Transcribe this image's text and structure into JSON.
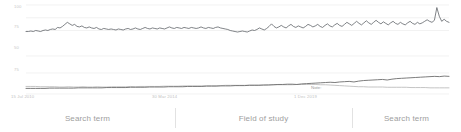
{
  "chart_data": [
    {
      "type": "line",
      "title": "",
      "panel": "top",
      "xlabel": "",
      "ylabel": "",
      "grid": true,
      "legend_position": "none",
      "ylim": [
        0,
        100
      ],
      "yticks": [
        "100",
        "75",
        "50"
      ],
      "xticks": [
        "15 Jul 2010",
        "30 Mar 2014",
        "1 Dec 2019"
      ],
      "series": [
        {
          "name": "Search term",
          "color": "#5f6368",
          "x": [
            0,
            1,
            2,
            3,
            4,
            5,
            6,
            7,
            8,
            9,
            10,
            11,
            12,
            13,
            14,
            15,
            16,
            17,
            18,
            19,
            20,
            21,
            22,
            23,
            24,
            25,
            26,
            27,
            28,
            29,
            30,
            31,
            32,
            33,
            34,
            35,
            36,
            37,
            38,
            39,
            40,
            41,
            42,
            43,
            44,
            45,
            46,
            47,
            48,
            49,
            50,
            51,
            52,
            53,
            54,
            55,
            56,
            57,
            58,
            59,
            60,
            61,
            62,
            63,
            64,
            65,
            66,
            67,
            68,
            69,
            70,
            71,
            72,
            73,
            74,
            75,
            76,
            77,
            78,
            79,
            80,
            81,
            82,
            83,
            84,
            85,
            86,
            87,
            88,
            89,
            90,
            91,
            92,
            93,
            94,
            95,
            96,
            97,
            98,
            99,
            100,
            101,
            102,
            103,
            104,
            105,
            106,
            107,
            108,
            109,
            110,
            111,
            112,
            113,
            114,
            115,
            116,
            117,
            118,
            119,
            120,
            121,
            122,
            123,
            124,
            125,
            126,
            127,
            128,
            129,
            130,
            131,
            132,
            133,
            134,
            135,
            136,
            137,
            138,
            139,
            140,
            141,
            142,
            143,
            144,
            145,
            146,
            147,
            148,
            149,
            150,
            151,
            152,
            153,
            154,
            155,
            156,
            157,
            158,
            159,
            160,
            161,
            162,
            163,
            164,
            165,
            166,
            167,
            168,
            169,
            170,
            171,
            172,
            173,
            174,
            175,
            176,
            177,
            178,
            179
          ],
          "values": [
            48,
            48,
            49,
            48,
            50,
            49,
            48,
            50,
            51,
            50,
            52,
            53,
            52,
            56,
            55,
            58,
            62,
            66,
            63,
            60,
            62,
            58,
            57,
            59,
            56,
            55,
            57,
            55,
            54,
            56,
            53,
            52,
            54,
            53,
            52,
            53,
            52,
            51,
            53,
            52,
            51,
            53,
            54,
            52,
            53,
            55,
            53,
            52,
            54,
            56,
            54,
            53,
            55,
            54,
            53,
            55,
            54,
            53,
            55,
            57,
            55,
            54,
            56,
            55,
            54,
            56,
            55,
            54,
            56,
            55,
            54,
            55,
            57,
            55,
            54,
            56,
            55,
            54,
            56,
            57,
            55,
            54,
            53,
            52,
            50,
            49,
            48,
            47,
            48,
            49,
            48,
            47,
            49,
            51,
            50,
            52,
            55,
            53,
            51,
            54,
            58,
            63,
            58,
            55,
            57,
            60,
            57,
            55,
            59,
            62,
            58,
            56,
            59,
            57,
            55,
            58,
            62,
            60,
            57,
            59,
            62,
            58,
            56,
            60,
            63,
            59,
            57,
            61,
            64,
            60,
            58,
            62,
            66,
            63,
            60,
            64,
            68,
            64,
            61,
            65,
            69,
            65,
            62,
            66,
            70,
            66,
            63,
            67,
            64,
            61,
            65,
            68,
            64,
            62,
            66,
            63,
            61,
            65,
            68,
            64,
            62,
            66,
            63,
            65,
            68,
            71,
            68,
            66,
            70,
            95,
            78,
            68,
            72,
            68,
            66
          ]
        }
      ]
    },
    {
      "type": "line",
      "title": "",
      "panel": "bottom",
      "xlabel": "",
      "ylabel": "",
      "grid": true,
      "legend_position": "none",
      "ylim": [
        0,
        100
      ],
      "yticks": [
        "75"
      ],
      "annotations": [
        {
          "label": "Note:",
          "x": 311,
          "y": 85
        }
      ],
      "series": [
        {
          "name": "Field of study",
          "color": "#bdbdbd",
          "x": [
            0,
            1,
            2,
            3,
            4,
            5,
            6,
            7,
            8,
            9,
            10,
            11,
            12,
            13,
            14,
            15,
            16,
            17,
            18,
            19,
            20,
            21,
            22,
            23,
            24,
            25,
            26,
            27,
            28,
            29,
            30,
            31,
            32,
            33,
            34,
            35,
            36,
            37,
            38,
            39,
            40,
            41,
            42,
            43,
            44,
            45,
            46,
            47,
            48,
            49,
            50,
            51,
            52,
            53,
            54,
            55,
            56,
            57,
            58,
            59,
            60,
            61,
            62,
            63,
            64,
            65,
            66,
            67,
            68,
            69,
            70,
            71,
            72,
            73,
            74,
            75,
            76,
            77,
            78,
            79,
            80,
            81,
            82,
            83,
            84,
            85,
            86,
            87,
            88,
            89
          ],
          "values": [
            27,
            27,
            27,
            26,
            26,
            26,
            26,
            25,
            25,
            26,
            25,
            25,
            26,
            25,
            25,
            26,
            25,
            25,
            26,
            26,
            26,
            26,
            27,
            26,
            27,
            27,
            27,
            27,
            27,
            28,
            28,
            28,
            28,
            29,
            29,
            29,
            29,
            29,
            30,
            30,
            30,
            30,
            31,
            31,
            31,
            31,
            31,
            32,
            32,
            32,
            32,
            33,
            33,
            33,
            33,
            33,
            33,
            34,
            34,
            34,
            34,
            34,
            33,
            33,
            32,
            31,
            30,
            29,
            28,
            27,
            26,
            26,
            25,
            25,
            25,
            25,
            24,
            24,
            24,
            24,
            24,
            23,
            23,
            23,
            23,
            22,
            22,
            22,
            22,
            22
          ]
        },
        {
          "name": "Search term",
          "color": "#6d6d6d",
          "x": [
            0,
            1,
            2,
            3,
            4,
            5,
            6,
            7,
            8,
            9,
            10,
            11,
            12,
            13,
            14,
            15,
            16,
            17,
            18,
            19,
            20,
            21,
            22,
            23,
            24,
            25,
            26,
            27,
            28,
            29,
            30,
            31,
            32,
            33,
            34,
            35,
            36,
            37,
            38,
            39,
            40,
            41,
            42,
            43,
            44,
            45,
            46,
            47,
            48,
            49,
            50,
            51,
            52,
            53,
            54,
            55,
            56,
            57,
            58,
            59,
            60,
            61,
            62,
            63,
            64,
            65,
            66,
            67,
            68,
            69,
            70,
            71,
            72,
            73,
            74,
            75,
            76,
            77,
            78,
            79,
            80,
            81,
            82,
            83,
            84,
            85,
            86,
            87,
            88,
            89
          ],
          "values": [
            20,
            20,
            20,
            20,
            20,
            21,
            21,
            21,
            21,
            21,
            21,
            22,
            22,
            22,
            22,
            22,
            22,
            23,
            23,
            23,
            23,
            23,
            24,
            24,
            24,
            24,
            25,
            25,
            25,
            25,
            26,
            26,
            26,
            26,
            27,
            27,
            27,
            27,
            28,
            28,
            28,
            29,
            29,
            29,
            30,
            30,
            30,
            31,
            31,
            31,
            32,
            32,
            33,
            34,
            34,
            35,
            35,
            34,
            36,
            37,
            38,
            39,
            40,
            41,
            42,
            41,
            43,
            44,
            45,
            43,
            46,
            48,
            49,
            50,
            51,
            52,
            50,
            53,
            55,
            56,
            57,
            58,
            59,
            60,
            61,
            62,
            63,
            62,
            64,
            63
          ]
        }
      ]
    }
  ],
  "axes": {
    "top_yticks": [
      {
        "label": "100",
        "top": 6
      },
      {
        "label": "75",
        "top": 26
      },
      {
        "label": "50",
        "top": 47
      }
    ],
    "bottom_yticks": [
      {
        "label": "75",
        "top": 69
      }
    ],
    "xticks": [
      {
        "label": "15 Jul 2010",
        "left": 11
      },
      {
        "label": "30 Mar 2014",
        "left": 152
      },
      {
        "label": "1 Dec 2019",
        "left": 294
      }
    ]
  },
  "annotation": {
    "note_label": "Note:"
  },
  "legend": {
    "items": [
      {
        "label": "Search term"
      },
      {
        "label": "Field of study"
      },
      {
        "label": "Search term"
      }
    ]
  },
  "colors": {
    "line_dark": "#5f6368",
    "line_mid": "#6d6d6d",
    "line_light": "#bdbdbd",
    "grid": "#ededed",
    "axis_text": "#c2c2c2",
    "legend_text": "#9e9e9e",
    "divider": "#e2e2e2"
  }
}
